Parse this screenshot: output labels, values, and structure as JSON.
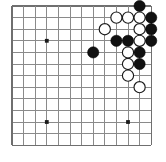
{
  "diagram": {
    "kind": "go-board",
    "board": {
      "cols": 13,
      "rows": 13,
      "origin_x": 12,
      "origin_y": 6,
      "spacing": 11.6,
      "stone_radius": 5.6,
      "line_color": "#8a8a8a",
      "edge_color": "#6f6f6f",
      "background_color": "#ffffff",
      "black_color": "#111111",
      "white_color": "#ffffff"
    },
    "star_points": [
      {
        "col": 3,
        "row": 3
      },
      {
        "col": 3,
        "row": 10
      },
      {
        "col": 10,
        "row": 10
      }
    ],
    "stones": [
      {
        "col": 11,
        "row": 0,
        "color": "black"
      },
      {
        "col": 9,
        "row": 1,
        "color": "white"
      },
      {
        "col": 10,
        "row": 1,
        "color": "white"
      },
      {
        "col": 11,
        "row": 1,
        "color": "white"
      },
      {
        "col": 12,
        "row": 1,
        "color": "black"
      },
      {
        "col": 8,
        "row": 2,
        "color": "white"
      },
      {
        "col": 11,
        "row": 2,
        "color": "white"
      },
      {
        "col": 12,
        "row": 2,
        "color": "black"
      },
      {
        "col": 9,
        "row": 3,
        "color": "black"
      },
      {
        "col": 10,
        "row": 3,
        "color": "black"
      },
      {
        "col": 11,
        "row": 3,
        "color": "white"
      },
      {
        "col": 12,
        "row": 3,
        "color": "black"
      },
      {
        "col": 7,
        "row": 4,
        "color": "black"
      },
      {
        "col": 10,
        "row": 4,
        "color": "white"
      },
      {
        "col": 11,
        "row": 4,
        "color": "black"
      },
      {
        "col": 10,
        "row": 5,
        "color": "white"
      },
      {
        "col": 11,
        "row": 5,
        "color": "black"
      },
      {
        "col": 10,
        "row": 6,
        "color": "white"
      },
      {
        "col": 11,
        "row": 7,
        "color": "white"
      }
    ],
    "counts": {
      "black_stones": 9,
      "white_stones": 10,
      "total_stones": 19
    }
  }
}
